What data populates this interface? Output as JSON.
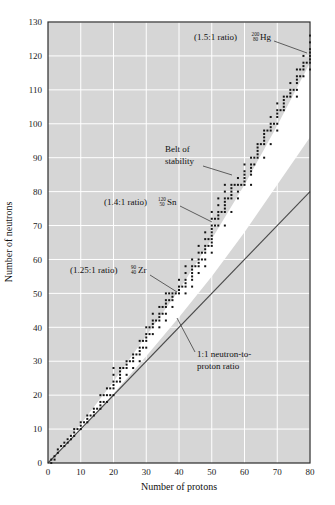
{
  "chart_data": {
    "type": "scatter",
    "title": "",
    "xlabel": "Number of protons",
    "ylabel": "Number of neutrons",
    "xlim": [
      0,
      80
    ],
    "ylim": [
      0,
      130
    ],
    "xticks": [
      0,
      10,
      20,
      30,
      40,
      50,
      60,
      70,
      80
    ],
    "yticks": [
      0,
      10,
      20,
      30,
      40,
      50,
      60,
      70,
      80,
      90,
      100,
      110,
      120,
      130
    ],
    "grid": true,
    "legend": "none",
    "series": [
      {
        "name": "Stable nuclides",
        "marker": "square",
        "color": "#141414",
        "points": [
          [
            1,
            0
          ],
          [
            1,
            1
          ],
          [
            2,
            1
          ],
          [
            2,
            2
          ],
          [
            3,
            3
          ],
          [
            3,
            4
          ],
          [
            4,
            5
          ],
          [
            5,
            5
          ],
          [
            5,
            6
          ],
          [
            6,
            6
          ],
          [
            6,
            7
          ],
          [
            7,
            7
          ],
          [
            7,
            8
          ],
          [
            8,
            8
          ],
          [
            8,
            9
          ],
          [
            8,
            10
          ],
          [
            9,
            10
          ],
          [
            10,
            10
          ],
          [
            10,
            11
          ],
          [
            10,
            12
          ],
          [
            11,
            12
          ],
          [
            12,
            12
          ],
          [
            12,
            13
          ],
          [
            12,
            14
          ],
          [
            13,
            14
          ],
          [
            14,
            14
          ],
          [
            14,
            15
          ],
          [
            14,
            16
          ],
          [
            15,
            16
          ],
          [
            16,
            16
          ],
          [
            16,
            17
          ],
          [
            16,
            18
          ],
          [
            16,
            20
          ],
          [
            17,
            18
          ],
          [
            17,
            20
          ],
          [
            18,
            18
          ],
          [
            18,
            20
          ],
          [
            18,
            22
          ],
          [
            19,
            20
          ],
          [
            19,
            22
          ],
          [
            20,
            20
          ],
          [
            20,
            22
          ],
          [
            20,
            23
          ],
          [
            20,
            24
          ],
          [
            20,
            26
          ],
          [
            20,
            28
          ],
          [
            21,
            24
          ],
          [
            22,
            24
          ],
          [
            22,
            25
          ],
          [
            22,
            26
          ],
          [
            22,
            27
          ],
          [
            22,
            28
          ],
          [
            23,
            28
          ],
          [
            24,
            26
          ],
          [
            24,
            28
          ],
          [
            24,
            29
          ],
          [
            24,
            30
          ],
          [
            25,
            30
          ],
          [
            26,
            28
          ],
          [
            26,
            30
          ],
          [
            26,
            31
          ],
          [
            26,
            32
          ],
          [
            27,
            32
          ],
          [
            28,
            30
          ],
          [
            28,
            32
          ],
          [
            28,
            33
          ],
          [
            28,
            34
          ],
          [
            28,
            36
          ],
          [
            29,
            34
          ],
          [
            29,
            36
          ],
          [
            30,
            34
          ],
          [
            30,
            36
          ],
          [
            30,
            37
          ],
          [
            30,
            38
          ],
          [
            30,
            40
          ],
          [
            31,
            38
          ],
          [
            31,
            40
          ],
          [
            32,
            38
          ],
          [
            32,
            40
          ],
          [
            32,
            41
          ],
          [
            32,
            42
          ],
          [
            32,
            44
          ],
          [
            33,
            42
          ],
          [
            34,
            40
          ],
          [
            34,
            42
          ],
          [
            34,
            43
          ],
          [
            34,
            44
          ],
          [
            34,
            46
          ],
          [
            35,
            44
          ],
          [
            35,
            46
          ],
          [
            36,
            42
          ],
          [
            36,
            44
          ],
          [
            36,
            46
          ],
          [
            36,
            47
          ],
          [
            36,
            48
          ],
          [
            36,
            50
          ],
          [
            37,
            48
          ],
          [
            37,
            50
          ],
          [
            38,
            46
          ],
          [
            38,
            48
          ],
          [
            38,
            49
          ],
          [
            38,
            50
          ],
          [
            39,
            50
          ],
          [
            40,
            50
          ],
          [
            40,
            51
          ],
          [
            40,
            52
          ],
          [
            40,
            54
          ],
          [
            41,
            52
          ],
          [
            42,
            50
          ],
          [
            42,
            52
          ],
          [
            42,
            53
          ],
          [
            42,
            54
          ],
          [
            42,
            56
          ],
          [
            42,
            58
          ],
          [
            44,
            52
          ],
          [
            44,
            54
          ],
          [
            44,
            55
          ],
          [
            44,
            56
          ],
          [
            44,
            57
          ],
          [
            44,
            58
          ],
          [
            44,
            60
          ],
          [
            45,
            58
          ],
          [
            46,
            56
          ],
          [
            46,
            58
          ],
          [
            46,
            59
          ],
          [
            46,
            60
          ],
          [
            46,
            62
          ],
          [
            46,
            64
          ],
          [
            47,
            60
          ],
          [
            47,
            62
          ],
          [
            48,
            58
          ],
          [
            48,
            60
          ],
          [
            48,
            62
          ],
          [
            48,
            63
          ],
          [
            48,
            64
          ],
          [
            48,
            66
          ],
          [
            48,
            68
          ],
          [
            49,
            64
          ],
          [
            49,
            66
          ],
          [
            50,
            62
          ],
          [
            50,
            64
          ],
          [
            50,
            65
          ],
          [
            50,
            66
          ],
          [
            50,
            67
          ],
          [
            50,
            68
          ],
          [
            50,
            69
          ],
          [
            50,
            70
          ],
          [
            50,
            72
          ],
          [
            50,
            74
          ],
          [
            51,
            70
          ],
          [
            51,
            72
          ],
          [
            52,
            70
          ],
          [
            52,
            72
          ],
          [
            52,
            73
          ],
          [
            52,
            74
          ],
          [
            52,
            76
          ],
          [
            52,
            78
          ],
          [
            53,
            74
          ],
          [
            54,
            70
          ],
          [
            54,
            74
          ],
          [
            54,
            75
          ],
          [
            54,
            76
          ],
          [
            54,
            77
          ],
          [
            54,
            78
          ],
          [
            54,
            80
          ],
          [
            54,
            82
          ],
          [
            55,
            78
          ],
          [
            56,
            74
          ],
          [
            56,
            78
          ],
          [
            56,
            79
          ],
          [
            56,
            80
          ],
          [
            56,
            81
          ],
          [
            56,
            82
          ],
          [
            57,
            82
          ],
          [
            58,
            78
          ],
          [
            58,
            80
          ],
          [
            58,
            82
          ],
          [
            58,
            84
          ],
          [
            59,
            82
          ],
          [
            60,
            82
          ],
          [
            60,
            83
          ],
          [
            60,
            84
          ],
          [
            60,
            85
          ],
          [
            60,
            86
          ],
          [
            60,
            88
          ],
          [
            62,
            82
          ],
          [
            62,
            85
          ],
          [
            62,
            86
          ],
          [
            62,
            87
          ],
          [
            62,
            88
          ],
          [
            62,
            90
          ],
          [
            63,
            88
          ],
          [
            63,
            90
          ],
          [
            64,
            90
          ],
          [
            64,
            91
          ],
          [
            64,
            92
          ],
          [
            64,
            93
          ],
          [
            64,
            94
          ],
          [
            65,
            94
          ],
          [
            66,
            90
          ],
          [
            66,
            94
          ],
          [
            66,
            95
          ],
          [
            66,
            96
          ],
          [
            66,
            97
          ],
          [
            66,
            98
          ],
          [
            67,
            98
          ],
          [
            68,
            94
          ],
          [
            68,
            98
          ],
          [
            68,
            99
          ],
          [
            68,
            100
          ],
          [
            68,
            102
          ],
          [
            69,
            100
          ],
          [
            70,
            98
          ],
          [
            70,
            100
          ],
          [
            70,
            102
          ],
          [
            70,
            103
          ],
          [
            70,
            104
          ],
          [
            70,
            106
          ],
          [
            71,
            104
          ],
          [
            72,
            104
          ],
          [
            72,
            105
          ],
          [
            72,
            106
          ],
          [
            72,
            107
          ],
          [
            72,
            108
          ],
          [
            73,
            108
          ],
          [
            74,
            108
          ],
          [
            74,
            109
          ],
          [
            74,
            110
          ],
          [
            74,
            112
          ],
          [
            75,
            110
          ],
          [
            76,
            108
          ],
          [
            76,
            110
          ],
          [
            76,
            112
          ],
          [
            76,
            113
          ],
          [
            76,
            114
          ],
          [
            76,
            116
          ],
          [
            77,
            114
          ],
          [
            77,
            116
          ],
          [
            78,
            114
          ],
          [
            78,
            116
          ],
          [
            78,
            117
          ],
          [
            78,
            118
          ],
          [
            78,
            120
          ],
          [
            79,
            118
          ],
          [
            80,
            116
          ],
          [
            80,
            118
          ],
          [
            80,
            119
          ],
          [
            80,
            120
          ],
          [
            80,
            121
          ],
          [
            80,
            122
          ],
          [
            80,
            124
          ],
          [
            80,
            126
          ]
        ]
      }
    ],
    "reference_line": {
      "name": "1:1 neutron-to-proton ratio",
      "slope": 1,
      "intercept": 0,
      "color": "#4a4a4a"
    },
    "band": {
      "name": "Belt of stability",
      "description": "White band separating the 1:1 line from the stable nuclide points",
      "color": "#ffffff"
    },
    "annotations": [
      {
        "id": "hg",
        "ratio_text": "(1.5:1 ratio)",
        "mass_number": "200",
        "atomic_number": "80",
        "element": "Hg",
        "target_point": [
          80,
          120
        ]
      },
      {
        "id": "sn",
        "ratio_text": "(1.4:1 ratio)",
        "mass_number": "120",
        "atomic_number": "50",
        "element": "Sn",
        "target_point": [
          50,
          70
        ]
      },
      {
        "id": "zr",
        "ratio_text": "(1.25:1 ratio)",
        "mass_number": "90",
        "atomic_number": "40",
        "element": "Zr",
        "target_point": [
          40,
          50
        ]
      },
      {
        "id": "belt",
        "line1": "Belt of",
        "line2": "stability"
      },
      {
        "id": "ratio11",
        "line1": "1:1 neutron-to-",
        "line2": "proton ratio"
      }
    ],
    "colors": {
      "plot_background": "#d6d6d6",
      "gridline": "#ffffff",
      "frame": "#2b2b2b",
      "point": "#141414",
      "reference_line": "#4a4a4a",
      "band": "#ffffff",
      "page_background": "#ffffff"
    }
  },
  "axes": {
    "x_title": "Number of protons",
    "y_title": "Number of neutrons",
    "x_tick_labels": [
      "0",
      "10",
      "20",
      "30",
      "40",
      "50",
      "60",
      "70",
      "80"
    ],
    "y_tick_labels": [
      "0",
      "10",
      "20",
      "30",
      "40",
      "50",
      "60",
      "70",
      "80",
      "90",
      "100",
      "110",
      "120",
      "130"
    ]
  },
  "labels": {
    "belt_line1": "Belt of",
    "belt_line2": "stability",
    "ratio11_line1": "1:1 neutron-to-",
    "ratio11_line2": "proton ratio",
    "hg_ratio": "(1.5:1 ratio)",
    "hg_mass": "200",
    "hg_number": "80",
    "hg_symbol": "Hg",
    "sn_ratio": "(1.4:1 ratio)",
    "sn_mass": "120",
    "sn_number": "50",
    "sn_symbol": "Sn",
    "zr_ratio": "(1.25:1 ratio)",
    "zr_mass": "90",
    "zr_number": "40",
    "zr_symbol": "Zr"
  }
}
